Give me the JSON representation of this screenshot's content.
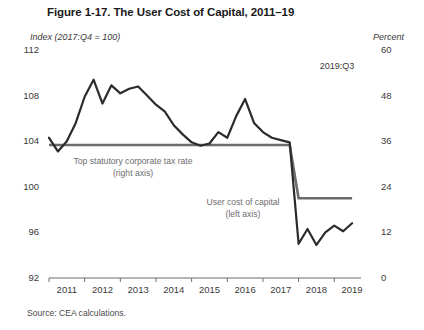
{
  "figure": {
    "title": "Figure 1-17. The User Cost of Capital, 2011–19",
    "source": "Source: CEA calculations."
  },
  "annotations": {
    "tax_rate": "Top statutory corporate tax rate",
    "tax_rate_axis": "(right axis)",
    "user_cost": "User cost of capital",
    "user_cost_axis": "(left axis)",
    "last_date": "2019:Q3"
  },
  "chart_data": {
    "type": "line",
    "title": "Figure 1-17. The User Cost of Capital, 2011–19",
    "xlabel": "",
    "ylabel": "Index (2017:Q4 = 100)",
    "y2label": "Percent",
    "ylim": [
      92,
      112
    ],
    "y2lim": [
      0,
      60
    ],
    "yticks": [
      92,
      96,
      100,
      104,
      108,
      112
    ],
    "y2ticks": [
      0,
      12,
      24,
      36,
      48,
      60
    ],
    "xlim": [
      2011.0,
      2019.75
    ],
    "xticks": [
      2011,
      2012,
      2013,
      2014,
      2015,
      2016,
      2017,
      2018,
      2019
    ],
    "xtick_labels": [
      "2011",
      "2012",
      "2013",
      "2014",
      "2015",
      "2016",
      "2017",
      "2018",
      "2019"
    ],
    "grid": false,
    "legend": "annotations-inline",
    "series": [
      {
        "name": "User cost of capital",
        "axis": "left",
        "units": "Index (2017:Q4 = 100)",
        "color": "#2b2b2b",
        "x": [
          2011.0,
          2011.25,
          2011.5,
          2011.75,
          2012.0,
          2012.25,
          2012.5,
          2012.75,
          2013.0,
          2013.25,
          2013.5,
          2013.75,
          2014.0,
          2014.25,
          2014.5,
          2014.75,
          2015.0,
          2015.25,
          2015.5,
          2015.75,
          2016.0,
          2016.25,
          2016.5,
          2016.75,
          2017.0,
          2017.25,
          2017.5,
          2017.75,
          2018.0,
          2018.25,
          2018.5,
          2018.75,
          2019.0,
          2019.25,
          2019.5
        ],
        "values": [
          104.3,
          103.1,
          104.0,
          105.6,
          107.9,
          109.4,
          107.3,
          108.9,
          108.2,
          108.6,
          108.8,
          108.0,
          107.2,
          106.6,
          105.4,
          104.6,
          103.9,
          103.6,
          103.8,
          104.8,
          104.3,
          106.2,
          107.7,
          105.6,
          104.8,
          104.3,
          104.1,
          103.9,
          95.0,
          96.3,
          94.9,
          96.0,
          96.6,
          96.1,
          96.8
        ]
      },
      {
        "name": "Top statutory corporate tax rate",
        "axis": "right",
        "units": "Percent",
        "color": "#6b6b6b",
        "x": [
          2011.0,
          2017.75,
          2018.0,
          2019.5
        ],
        "values": [
          35,
          35,
          21,
          21
        ]
      }
    ]
  }
}
